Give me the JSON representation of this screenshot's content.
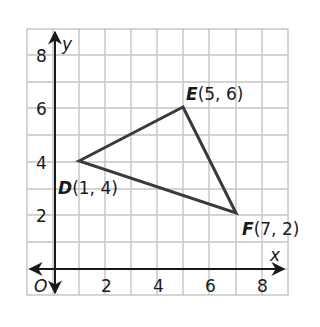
{
  "figure": {
    "axes": {
      "x_label": "x",
      "y_label": "y",
      "origin_label": "O",
      "x_ticks": [
        "2",
        "4",
        "6",
        "8"
      ],
      "y_ticks": [
        "2",
        "4",
        "6",
        "8"
      ]
    },
    "points": [
      {
        "name": "D",
        "coords": "(1, 4)",
        "x": 1,
        "y": 4
      },
      {
        "name": "E",
        "coords": "(5, 6)",
        "x": 5,
        "y": 6
      },
      {
        "name": "F",
        "coords": "(7, 2)",
        "x": 7,
        "y": 2
      }
    ],
    "colors": {
      "grid": "#c4c4c4",
      "axes": "#1a1a1a",
      "triangle": "#3a3a3a"
    }
  }
}
